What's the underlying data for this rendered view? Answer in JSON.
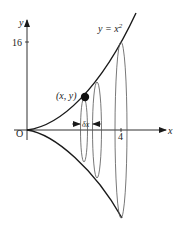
{
  "diagram": {
    "curve_label": "y = x",
    "curve_exponent": "2",
    "y_axis_label": "y",
    "x_axis_label": "x",
    "origin_label": "O",
    "y_tick_label": "16",
    "x_tick_label": "4",
    "point_label": "(x, y)",
    "strip_width_label": "δx",
    "colors": {
      "stroke": "#1a1a1a",
      "thin_stroke": "#555555",
      "background": "#ffffff"
    }
  }
}
